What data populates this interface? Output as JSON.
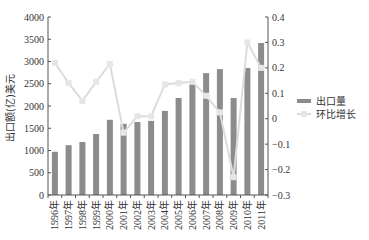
{
  "chart_data": {
    "type": "bar+line",
    "title": "",
    "categories": [
      "1996年",
      "1997年",
      "1998年",
      "1999年",
      "2000年",
      "2001年",
      "2002年",
      "2003年",
      "2004年",
      "2005年",
      "2006年",
      "2007年",
      "2008年",
      "2009年",
      "2010年",
      "2011年"
    ],
    "series": [
      {
        "name": "出口量",
        "type": "bar",
        "axis": "left",
        "color": "#8c8c8c",
        "values": [
          970,
          1120,
          1190,
          1370,
          1690,
          1600,
          1640,
          1665,
          1890,
          2180,
          2495,
          2740,
          2830,
          2180,
          2855,
          3415
        ]
      },
      {
        "name": "环比增长",
        "type": "line",
        "axis": "right",
        "color": "#dcdcdc",
        "values": [
          0.22,
          0.14,
          0.07,
          0.145,
          0.215,
          -0.055,
          0.01,
          0.01,
          0.135,
          0.14,
          0.145,
          0.09,
          0.025,
          -0.23,
          0.3,
          0.2
        ]
      }
    ],
    "ylabel": "出口额(亿)美元",
    "xlabel": "",
    "ylim": [
      0,
      4000
    ],
    "yticks": [
      "0",
      "500",
      "1000",
      "1500",
      "2000",
      "2500",
      "3000",
      "3500",
      "4000"
    ],
    "y2lim": [
      -0.3,
      0.4
    ],
    "y2ticks": [
      "-0.3",
      "-0.2",
      "-0.1",
      "0",
      "0.1",
      "0.2",
      "0.3",
      "0.4"
    ],
    "grid": false,
    "legend_position": "right"
  },
  "legend": {
    "items": [
      {
        "label": "出口量"
      },
      {
        "label": "环比增长"
      }
    ]
  }
}
